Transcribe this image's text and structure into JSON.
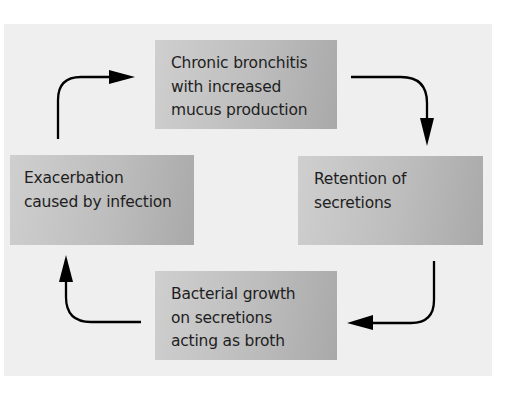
{
  "diagram": {
    "type": "cycle",
    "direction": "clockwise",
    "colors": {
      "background": "#ffffff",
      "panel": "#efefef",
      "box_light": "#cfcfcf",
      "box_dark": "#a9a9a9",
      "text": "#1e1e1e",
      "arrow": "#000000"
    },
    "nodes": [
      {
        "id": "top",
        "position": "top",
        "label": "Chronic bronchitis\nwith increased\nmucus production"
      },
      {
        "id": "right",
        "position": "right",
        "label": "Retention of\nsecretions"
      },
      {
        "id": "bottom",
        "position": "bottom",
        "label": "Bacterial growth\non secretions\nacting as broth"
      },
      {
        "id": "left",
        "position": "left",
        "label": "Exacerbation\ncaused by infection"
      }
    ],
    "edges": [
      {
        "from": "top",
        "to": "right"
      },
      {
        "from": "right",
        "to": "bottom"
      },
      {
        "from": "bottom",
        "to": "left"
      },
      {
        "from": "left",
        "to": "top"
      }
    ]
  }
}
